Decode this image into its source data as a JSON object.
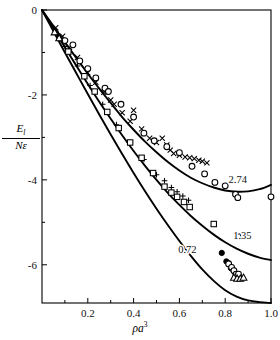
{
  "figure": {
    "background": "#ffffff",
    "ink": "#000000"
  },
  "axes": {
    "x_label": "ρa",
    "x_label_exponent": "3",
    "y_label_numerator": "E",
    "y_label_numerator_sub": "l",
    "y_label_denominator": "Nε",
    "x_ticks": [
      "0.2",
      "0.4",
      "0.6",
      "0.8",
      "1.0"
    ],
    "y_ticks": [
      "0",
      "-2",
      "-4",
      "-6"
    ]
  },
  "curve_labels": {
    "upper": "2.74",
    "middle": "1.35",
    "lower": "0.72"
  },
  "chart_data": {
    "type": "line",
    "title": "",
    "xlabel": "ρa³",
    "ylabel": "E_l/Nε",
    "xlim": [
      0.0,
      1.0
    ],
    "ylim": [
      -6.9,
      0.0
    ],
    "grid": false,
    "legend_position": "inline-curve-labels",
    "x_ticks": [
      0.2,
      0.4,
      0.6,
      0.8,
      1.0
    ],
    "x_minor_ticks": [
      0.1,
      0.3,
      0.5,
      0.7,
      0.9
    ],
    "y_ticks": [
      0,
      -2,
      -4,
      -6
    ],
    "y_minor_ticks": [
      -1,
      -3,
      -5
    ],
    "series": [
      {
        "name": "2.74",
        "kind": "curve",
        "label_x": 0.855,
        "label_y": -4.08,
        "x": [
          0.0,
          0.05,
          0.1,
          0.15,
          0.2,
          0.25,
          0.3,
          0.35,
          0.4,
          0.45,
          0.5,
          0.55,
          0.6,
          0.65,
          0.7,
          0.75,
          0.8,
          0.85,
          0.9,
          0.95,
          1.0
        ],
        "y": [
          0.0,
          -0.38,
          -0.76,
          -1.13,
          -1.5,
          -1.85,
          -2.19,
          -2.52,
          -2.82,
          -3.1,
          -3.35,
          -3.58,
          -3.78,
          -3.95,
          -4.08,
          -4.18,
          -4.25,
          -4.28,
          -4.27,
          -4.22,
          -4.12
        ]
      },
      {
        "name": "1.35",
        "kind": "curve",
        "label_x": 0.875,
        "label_y": -5.4,
        "x": [
          0.0,
          0.05,
          0.1,
          0.15,
          0.2,
          0.25,
          0.3,
          0.35,
          0.4,
          0.45,
          0.5,
          0.55,
          0.6,
          0.65,
          0.7,
          0.75,
          0.8,
          0.85,
          0.9,
          0.95,
          1.0
        ],
        "y": [
          0.0,
          -0.44,
          -0.88,
          -1.31,
          -1.74,
          -2.16,
          -2.56,
          -2.95,
          -3.32,
          -3.67,
          -4.0,
          -4.31,
          -4.59,
          -4.85,
          -5.08,
          -5.29,
          -5.47,
          -5.62,
          -5.74,
          -5.83,
          -5.89
        ]
      },
      {
        "name": "0.72",
        "kind": "curve",
        "label_x": 0.635,
        "label_y": -5.72,
        "x": [
          0.0,
          0.05,
          0.1,
          0.15,
          0.2,
          0.25,
          0.3,
          0.35,
          0.4,
          0.45,
          0.5,
          0.55,
          0.6,
          0.65,
          0.7,
          0.75,
          0.8,
          0.85,
          0.9,
          0.95,
          1.0
        ],
        "y": [
          0.0,
          -0.5,
          -1.0,
          -1.49,
          -1.98,
          -2.46,
          -2.93,
          -3.39,
          -3.84,
          -4.27,
          -4.68,
          -5.07,
          -5.44,
          -5.79,
          -6.11,
          -6.38,
          -6.6,
          -6.75,
          -6.84,
          -6.88,
          -6.9
        ]
      },
      {
        "name": "cross-points",
        "kind": "scatter",
        "marker": "x",
        "x": [
          0.06,
          0.09,
          0.12,
          0.155,
          0.2,
          0.235,
          0.27,
          0.3,
          0.315,
          0.35,
          0.385,
          0.4,
          0.435,
          0.47,
          0.5,
          0.525,
          0.545,
          0.56,
          0.575,
          0.6,
          0.625,
          0.645,
          0.665,
          0.685,
          0.7,
          0.72
        ],
        "y": [
          -0.42,
          -0.62,
          -0.88,
          -1.12,
          -1.48,
          -1.7,
          -1.94,
          -2.12,
          -2.22,
          -2.42,
          -2.62,
          -2.36,
          -2.8,
          -3.02,
          -3.12,
          -3.02,
          -3.18,
          -3.3,
          -3.38,
          -3.42,
          -3.46,
          -3.48,
          -3.5,
          -3.54,
          -3.56,
          -3.6
        ]
      },
      {
        "name": "open-circles-upper",
        "kind": "scatter",
        "marker": "circle-open",
        "x": [
          0.1,
          0.135,
          0.165,
          0.2,
          0.235,
          0.275,
          0.29,
          0.345,
          0.4,
          0.445,
          0.49,
          0.545,
          0.6,
          0.655,
          0.71,
          0.755,
          0.8,
          0.845,
          0.855,
          1.0
        ],
        "y": [
          -0.72,
          -0.82,
          -1.2,
          -1.38,
          -1.6,
          -1.84,
          -1.92,
          -2.22,
          -2.52,
          -2.9,
          -3.08,
          -3.22,
          -3.36,
          -3.68,
          -3.86,
          -4.06,
          -4.14,
          -4.34,
          -4.42,
          -4.4
        ]
      },
      {
        "name": "plus-points-middle",
        "kind": "scatter",
        "marker": "plus",
        "x": [
          0.06,
          0.1,
          0.155,
          0.21,
          0.265,
          0.325,
          0.385,
          0.445,
          0.5,
          0.535,
          0.565,
          0.59,
          0.615,
          0.64
        ],
        "y": [
          -0.5,
          -0.86,
          -1.32,
          -1.78,
          -2.22,
          -2.7,
          -3.12,
          -3.52,
          -3.88,
          -4.02,
          -4.18,
          -4.28,
          -4.38,
          -4.48
        ]
      },
      {
        "name": "open-squares-middle",
        "kind": "scatter",
        "marker": "square-open",
        "x": [
          0.115,
          0.185,
          0.23,
          0.285,
          0.335,
          0.385,
          0.435,
          0.485,
          0.535,
          0.565,
          0.59,
          0.62,
          0.645,
          0.75,
          0.855
        ],
        "y": [
          -0.98,
          -1.56,
          -1.92,
          -2.4,
          -2.78,
          -3.12,
          -3.48,
          -3.84,
          -4.16,
          -4.3,
          -4.4,
          -4.52,
          -4.64,
          -5.04,
          -5.34
        ]
      },
      {
        "name": "filled-circles-lower",
        "kind": "scatter",
        "marker": "circle-filled",
        "x": [
          0.785,
          0.805,
          0.815,
          0.825,
          0.835,
          0.845,
          0.855,
          0.865
        ],
        "y": [
          -5.72,
          -5.92,
          -5.96,
          -6.08,
          -6.12,
          -6.24,
          -6.28,
          -6.3
        ]
      },
      {
        "name": "open-circles-lower",
        "kind": "scatter",
        "marker": "circle-open",
        "x": [
          0.815,
          0.828,
          0.838,
          0.848,
          0.858
        ],
        "y": [
          -5.98,
          -6.06,
          -6.14,
          -6.22,
          -6.22
        ]
      },
      {
        "name": "triangles-lower",
        "kind": "scatter",
        "marker": "triangle-open",
        "x": [
          0.838,
          0.852,
          0.866,
          0.88
        ],
        "y": [
          -6.3,
          -6.32,
          -6.32,
          -6.3
        ]
      },
      {
        "name": "triangles-upper-left",
        "kind": "scatter",
        "marker": "triangle-open",
        "x": [
          0.055,
          0.075
        ],
        "y": [
          -0.52,
          -0.66
        ]
      }
    ]
  }
}
